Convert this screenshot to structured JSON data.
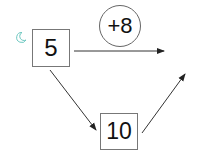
{
  "diagram": {
    "start_box": {
      "label": "5"
    },
    "operation_bubble": {
      "label": "+8"
    },
    "middle_box": {
      "label": "10"
    },
    "result_box": {
      "label": ""
    },
    "colors": {
      "stroke": "#333333",
      "moon": "#6cc7c0"
    }
  }
}
